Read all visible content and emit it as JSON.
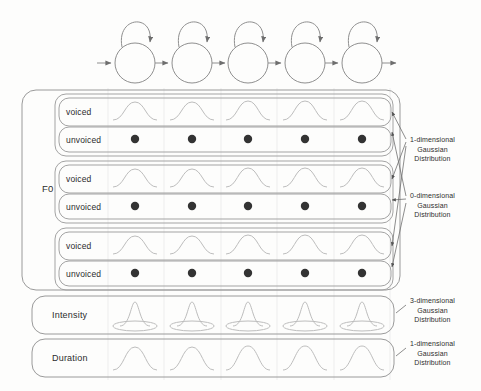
{
  "diagram": {
    "colors": {
      "stroke": "#8a8a8a",
      "stroke_dark": "#6e6e6e",
      "curve": "#b4b4b4",
      "dot": "#333333",
      "grid": "#e9e9e9",
      "text": "#2c2c2c",
      "background": "#fdfdfc"
    },
    "hmm": {
      "name": "hmm-state-chain",
      "state_count": 5,
      "states": [
        {
          "index": 1,
          "cx": 135,
          "cy": 63,
          "r": 20,
          "self_loop": true
        },
        {
          "index": 2,
          "cx": 192,
          "cy": 63,
          "r": 20,
          "self_loop": true
        },
        {
          "index": 3,
          "cx": 248,
          "cy": 63,
          "r": 20,
          "self_loop": true
        },
        {
          "index": 4,
          "cx": 305,
          "cy": 63,
          "r": 20,
          "self_loop": true
        },
        {
          "index": 5,
          "cx": 362,
          "cy": 63,
          "r": 20,
          "self_loop": true
        }
      ],
      "entry_arrow": true,
      "exit_arrow": true
    },
    "columns": {
      "count": 5,
      "centers": [
        135,
        192,
        248,
        305,
        362
      ],
      "gridline_x": [
        108,
        164,
        221,
        277,
        334,
        390
      ]
    },
    "f0": {
      "label": "F0",
      "groups": [
        {
          "name": "f0-stream-1",
          "rows": [
            {
              "label": "voiced",
              "glyph": "gaussian-curve-1d"
            },
            {
              "label": "unvoiced",
              "glyph": "dot-0d"
            }
          ]
        },
        {
          "name": "f0-stream-2",
          "rows": [
            {
              "label": "voiced",
              "glyph": "gaussian-curve-1d"
            },
            {
              "label": "unvoiced",
              "glyph": "dot-0d"
            }
          ]
        },
        {
          "name": "f0-stream-3",
          "rows": [
            {
              "label": "voiced",
              "glyph": "gaussian-curve-1d"
            },
            {
              "label": "unvoiced",
              "glyph": "dot-0d"
            }
          ]
        }
      ]
    },
    "sections": [
      {
        "name": "intensity-section",
        "label": "Intensity",
        "glyph": "gaussian-3d"
      },
      {
        "name": "duration-section",
        "label": "Duration",
        "glyph": "gaussian-curve-1d"
      }
    ],
    "annotations": [
      {
        "name": "annotation-voiced-1d",
        "lines": [
          "1-dimensional",
          "Gaussian",
          "Distribution"
        ],
        "x": 410,
        "y": 140
      },
      {
        "name": "annotation-unvoiced-0d",
        "lines": [
          "0-dimensional",
          "Gaussian",
          "Distribution"
        ],
        "x": 410,
        "y": 196
      },
      {
        "name": "annotation-intensity-3d",
        "lines": [
          "3-dimensional",
          "Gaussian",
          "Distribution"
        ],
        "x": 410,
        "y": 298
      },
      {
        "name": "annotation-duration-1d",
        "lines": [
          "1-dimensional",
          "Gaussian",
          "Distribution"
        ],
        "x": 410,
        "y": 340
      }
    ]
  }
}
